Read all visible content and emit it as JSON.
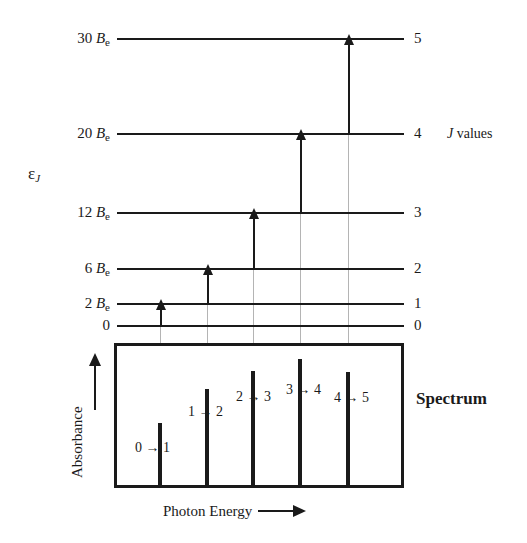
{
  "figure": {
    "y_axis_label": "ε",
    "y_axis_subscript": "J",
    "j_values_caption_italic": "J",
    "j_values_caption_text": " values",
    "spectrum_title": "Spectrum",
    "spectrum_y_label": "Absorbance",
    "spectrum_x_label": "Photon Energy"
  },
  "chart_data": {
    "type": "line",
    "xlabel": "Photon Energy",
    "ylabel": "Absorbance",
    "energy_axis_label": "ε_J",
    "energy_levels": [
      {
        "j": "0",
        "energy_label": "0",
        "coefficient": 0,
        "unit": "B_e",
        "y": 325
      },
      {
        "j": "1",
        "energy_label": "2 B",
        "coefficient": 2,
        "unit": "B_e",
        "y": 303
      },
      {
        "j": "2",
        "energy_label": "6 B",
        "coefficient": 6,
        "unit": "B_e",
        "y": 268
      },
      {
        "j": "3",
        "energy_label": "12 B",
        "coefficient": 12,
        "unit": "B_e",
        "y": 212
      },
      {
        "j": "4",
        "energy_label": "20 B",
        "coefficient": 20,
        "unit": "B_e",
        "y": 133
      },
      {
        "j": "5",
        "energy_label": "30 B",
        "coefficient": 30,
        "unit": "B_e",
        "y": 38
      }
    ],
    "transitions": [
      {
        "label": "0 → 1",
        "from_j": 0,
        "to_j": 1,
        "x": 160,
        "photon_energy_coeff": 2,
        "peak_height": 62
      },
      {
        "label": "1 → 2",
        "from_j": 1,
        "to_j": 2,
        "x": 207,
        "photon_energy_coeff": 4,
        "peak_height": 96
      },
      {
        "label": "2 → 3",
        "from_j": 2,
        "to_j": 3,
        "x": 253,
        "photon_energy_coeff": 6,
        "peak_height": 114
      },
      {
        "label": "3 → 4",
        "from_j": 3,
        "to_j": 4,
        "x": 300,
        "photon_energy_coeff": 8,
        "peak_height": 126
      },
      {
        "label": "4 → 5",
        "from_j": 4,
        "to_j": 5,
        "x": 348,
        "photon_energy_coeff": 10,
        "peak_height": 113
      }
    ],
    "grid": false,
    "legend": "none",
    "colors": {
      "ink": "#1a1a1a",
      "guide_line": "#b4b4b4",
      "background": "#ffffff"
    }
  }
}
